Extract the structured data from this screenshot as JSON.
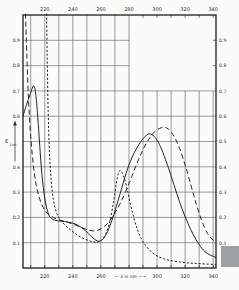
{
  "page": {
    "background": "#fbfbf8",
    "artifact_color": "#9aa0a4"
  },
  "chart_data": {
    "type": "line",
    "title": "",
    "xlabel": "λ in nm",
    "xlabel_display": "— λ in nm —→",
    "ylabel": "E 1cm",
    "ylabel_main": "E",
    "ylabel_sub": "1cm",
    "grid": "on",
    "frame_color": "#1c1c1c",
    "grid_color": "#4a4a4a",
    "curve_color": "#1a1a1a",
    "label_color": "#2b2b2b",
    "x_axis": {
      "min_nm": 204.5,
      "max_nm": 342,
      "grid_step_nm": 10,
      "grid_first_nm": 210,
      "grid_last_nm": 340,
      "top_tick_labels": [
        "220",
        "240",
        "260",
        "280",
        "300",
        "320",
        "340"
      ],
      "top_tick_values": [
        220,
        240,
        260,
        280,
        300,
        320,
        340
      ],
      "bottom_tick_labels": [
        "220",
        "240",
        "260",
        "300",
        "320",
        "340"
      ],
      "bottom_tick_values": [
        220,
        240,
        260,
        300,
        320,
        340
      ],
      "xlabel_position_nm": 281
    },
    "y_axis": {
      "min": 0,
      "max": 1.0,
      "grid_step": 0.1,
      "left_tick_labels": [
        "0.9",
        "0.8",
        "0.7",
        "0.6",
        "0.4",
        "0.3",
        "0.2",
        "0.1"
      ],
      "left_tick_values": [
        0.9,
        0.8,
        0.7,
        0.6,
        0.4,
        0.3,
        0.2,
        0.1
      ],
      "right_tick_labels": [
        "0.9",
        "0.8",
        "0.7",
        "0.6",
        "0.5",
        "0.4",
        "0.3",
        "0.2",
        "0.1"
      ],
      "right_tick_values": [
        0.9,
        0.8,
        0.7,
        0.6,
        0.5,
        0.4,
        0.3,
        0.2,
        0.1
      ],
      "ylabel_position_E": 0.5
    },
    "no_grid_region": {
      "from_nm": 280,
      "above_E": 0.7
    },
    "series": [
      {
        "name": "curve-solid",
        "style": "solid",
        "points": [
          [
            204.5,
            0.6
          ],
          [
            207,
            0.645
          ],
          [
            209.5,
            0.685
          ],
          [
            212,
            0.72
          ],
          [
            213.5,
            0.69
          ],
          [
            215,
            0.6
          ],
          [
            216.5,
            0.48
          ],
          [
            218,
            0.37
          ],
          [
            220,
            0.275
          ],
          [
            222.5,
            0.215
          ],
          [
            225,
            0.195
          ],
          [
            228,
            0.188
          ],
          [
            232,
            0.185
          ],
          [
            236,
            0.182
          ],
          [
            240,
            0.177
          ],
          [
            244,
            0.168
          ],
          [
            248,
            0.152
          ],
          [
            252,
            0.131
          ],
          [
            255,
            0.116
          ],
          [
            258,
            0.106
          ],
          [
            261,
            0.112
          ],
          [
            264,
            0.135
          ],
          [
            267,
            0.175
          ],
          [
            270,
            0.225
          ],
          [
            274,
            0.3
          ],
          [
            278,
            0.375
          ],
          [
            282,
            0.435
          ],
          [
            286,
            0.478
          ],
          [
            290,
            0.511
          ],
          [
            293,
            0.527
          ],
          [
            295,
            0.53
          ],
          [
            298,
            0.52
          ],
          [
            301,
            0.496
          ],
          [
            304,
            0.458
          ],
          [
            308,
            0.398
          ],
          [
            312,
            0.33
          ],
          [
            316,
            0.262
          ],
          [
            320,
            0.203
          ],
          [
            324,
            0.152
          ],
          [
            328,
            0.11
          ],
          [
            332,
            0.077
          ],
          [
            336,
            0.057
          ],
          [
            340,
            0.046
          ],
          [
            342,
            0.042
          ]
        ]
      },
      {
        "name": "curve-long-dash",
        "style": "long-dash",
        "points": [
          [
            206.3,
            1.005
          ],
          [
            206.8,
            0.92
          ],
          [
            207.5,
            0.8
          ],
          [
            208.5,
            0.66
          ],
          [
            210,
            0.52
          ],
          [
            212,
            0.4
          ],
          [
            214,
            0.325
          ],
          [
            216.5,
            0.272
          ],
          [
            219,
            0.238
          ],
          [
            222,
            0.215
          ],
          [
            226,
            0.2
          ],
          [
            230,
            0.191
          ],
          [
            235,
            0.183
          ],
          [
            240,
            0.174
          ],
          [
            245,
            0.163
          ],
          [
            250,
            0.152
          ],
          [
            254,
            0.147
          ],
          [
            258,
            0.15
          ],
          [
            262,
            0.162
          ],
          [
            266,
            0.185
          ],
          [
            270,
            0.218
          ],
          [
            274,
            0.258
          ],
          [
            278,
            0.307
          ],
          [
            282,
            0.362
          ],
          [
            286,
            0.418
          ],
          [
            290,
            0.468
          ],
          [
            294,
            0.508
          ],
          [
            298,
            0.537
          ],
          [
            302,
            0.552
          ],
          [
            305,
            0.557
          ],
          [
            308,
            0.549
          ],
          [
            312,
            0.522
          ],
          [
            316,
            0.474
          ],
          [
            320,
            0.408
          ],
          [
            324,
            0.33
          ],
          [
            328,
            0.252
          ],
          [
            332,
            0.185
          ],
          [
            336,
            0.136
          ],
          [
            339,
            0.115
          ],
          [
            342,
            0.102
          ]
        ]
      },
      {
        "name": "curve-short-dash",
        "style": "short-dash",
        "points": [
          [
            221.3,
            1.005
          ],
          [
            221.7,
            0.85
          ],
          [
            222.2,
            0.68
          ],
          [
            222.8,
            0.54
          ],
          [
            223.6,
            0.43
          ],
          [
            224.6,
            0.345
          ],
          [
            226,
            0.275
          ],
          [
            228,
            0.225
          ],
          [
            230.5,
            0.196
          ],
          [
            234,
            0.172
          ],
          [
            238,
            0.152
          ],
          [
            242,
            0.135
          ],
          [
            246,
            0.121
          ],
          [
            250,
            0.111
          ],
          [
            254,
            0.104
          ],
          [
            257,
            0.102
          ],
          [
            260,
            0.108
          ],
          [
            263,
            0.13
          ],
          [
            266,
            0.175
          ],
          [
            269,
            0.26
          ],
          [
            271,
            0.335
          ],
          [
            272.5,
            0.375
          ],
          [
            273.5,
            0.385
          ],
          [
            275,
            0.378
          ],
          [
            277,
            0.348
          ],
          [
            279,
            0.305
          ],
          [
            281,
            0.253
          ],
          [
            283.5,
            0.198
          ],
          [
            286,
            0.152
          ],
          [
            289,
            0.113
          ],
          [
            292,
            0.088
          ],
          [
            296,
            0.063
          ],
          [
            300,
            0.048
          ],
          [
            305,
            0.036
          ],
          [
            310,
            0.029
          ],
          [
            316,
            0.024
          ],
          [
            322,
            0.02
          ],
          [
            328,
            0.018
          ],
          [
            334,
            0.016
          ],
          [
            342,
            0.014
          ]
        ]
      }
    ]
  }
}
